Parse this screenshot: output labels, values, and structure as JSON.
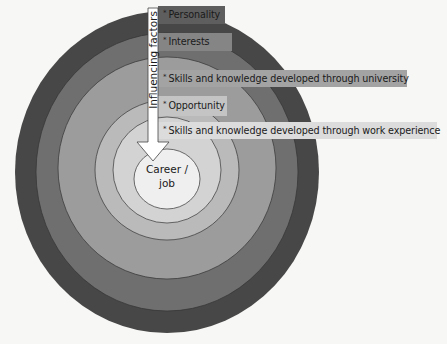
{
  "diagram": {
    "center": {
      "line1": "Career /",
      "line2": "job"
    },
    "arrow": {
      "label": "Influencing factors",
      "direction": "inward"
    },
    "rings": [
      {
        "name": "outer",
        "color": "#474747"
      },
      {
        "name": "ring-2",
        "color": "#6f6f6f"
      },
      {
        "name": "ring-3",
        "color": "#9c9c9c"
      },
      {
        "name": "ring-4",
        "color": "#bababa"
      },
      {
        "name": "ring-5",
        "color": "#d3d3d3"
      },
      {
        "name": "center",
        "color": "#efefef"
      }
    ],
    "factors": [
      {
        "bullet": "*",
        "label": "Personality",
        "box_color": "#5e5e5e"
      },
      {
        "bullet": "*",
        "label": "Interests",
        "box_color": "#858585"
      },
      {
        "bullet": "*",
        "label": "Skills and knowledge developed through university",
        "box_color": "#a3a3a3"
      },
      {
        "bullet": "*",
        "label": "Opportunity",
        "box_color": "#c4c4c4"
      },
      {
        "bullet": "*",
        "label": "Skills and knowledge developed through work experience",
        "box_color": "#dcdcdc"
      }
    ]
  }
}
